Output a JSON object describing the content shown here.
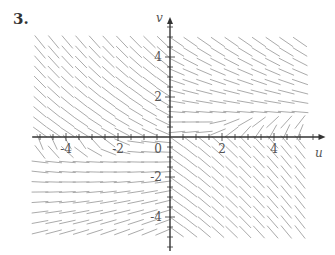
{
  "problem_number": "3.",
  "chart_data": {
    "type": "direction_field",
    "title": "",
    "xlabel": "u",
    "ylabel": "v",
    "xlim": [
      -5.2,
      5.5
    ],
    "ylim": [
      -5.5,
      5.5
    ],
    "x_tick_labels": [
      "-4",
      "-2",
      "0",
      "2",
      "4"
    ],
    "y_tick_labels": [
      "4",
      "2",
      "-2",
      "-4"
    ],
    "x_ticks_labeled": [
      -4,
      -2,
      0,
      2,
      4
    ],
    "y_ticks_labeled": [
      4,
      2,
      -2,
      -4
    ],
    "minor_tick_step": 0.5,
    "grid": false,
    "field_grid": {
      "u_min": -5,
      "u_max": 5,
      "v_min": -4.75,
      "v_max": 4.75,
      "nu": 20,
      "nv": 20
    },
    "field_description": "Slope field with saddle-like behavior: segments point down-right in upper half, up-left in lower-right, near horizontal around v≈1 for u>0 and v≈-1 for u<0",
    "segment_color": "#a0a0a0",
    "axis_color": "#333333"
  }
}
